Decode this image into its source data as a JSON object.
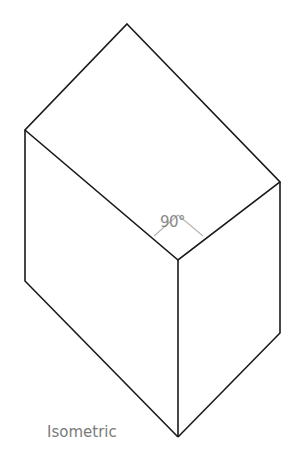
{
  "diagram": {
    "caption": "Isometric",
    "angle_label": "90°",
    "colors": {
      "edge": "#1a1a1a",
      "angle_marker": "#b5b5b5",
      "text": "#7a7a7a",
      "background": "#ffffff"
    },
    "shape": "isometric rectangular prism",
    "vertices": {
      "top": [
        127,
        24
      ],
      "left_top": [
        25,
        130
      ],
      "right_top": [
        280,
        182
      ],
      "front_top": [
        178,
        260
      ],
      "left_bottom": [
        25,
        281
      ],
      "right_bottom": [
        280,
        333
      ],
      "front_bottom": [
        178,
        437
      ]
    }
  }
}
